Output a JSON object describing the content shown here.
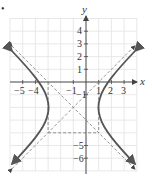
{
  "figure": {
    "bullet": "•",
    "axes": {
      "x_label": "x",
      "y_label": "y",
      "x_ticks": [
        {
          "value": -5,
          "label": "−5"
        },
        {
          "value": -4,
          "label": "−4"
        },
        {
          "value": -1,
          "label": "−1"
        },
        {
          "value": 1,
          "label": "1"
        },
        {
          "value": 2,
          "label": "2"
        },
        {
          "value": 3,
          "label": "3"
        }
      ],
      "y_ticks": [
        {
          "value": 4,
          "label": "4"
        },
        {
          "value": 3,
          "label": "3"
        },
        {
          "value": 2,
          "label": "2"
        },
        {
          "value": 1,
          "label": "1"
        },
        {
          "value": -1,
          "label": "−1"
        },
        {
          "value": -5,
          "label": "−5"
        },
        {
          "value": -6,
          "label": "−6"
        }
      ],
      "xlim": [
        -6,
        4
      ],
      "ylim": [
        -7,
        5
      ],
      "grid": true
    },
    "curve": {
      "type": "hyperbola",
      "equation": "(x+1)^2/4 - (y+2)^2/4 = 1",
      "center": [
        -1,
        -2
      ],
      "vertices": [
        [
          -3,
          -2
        ],
        [
          1,
          -2
        ]
      ],
      "color": "#555555"
    },
    "asymptotes": [
      {
        "slope": 1,
        "through": [
          -1,
          -2
        ],
        "style": "dashed"
      },
      {
        "slope": -1,
        "through": [
          -1,
          -2
        ],
        "style": "dashed"
      }
    ],
    "fundamental_rectangle": {
      "x": [
        -3,
        1
      ],
      "y": [
        -4,
        0
      ],
      "style": "dashed"
    },
    "colors": {
      "grid": "#e2e2e2",
      "axis": "#444444",
      "curve": "#555555",
      "dashed": "#777777"
    }
  }
}
